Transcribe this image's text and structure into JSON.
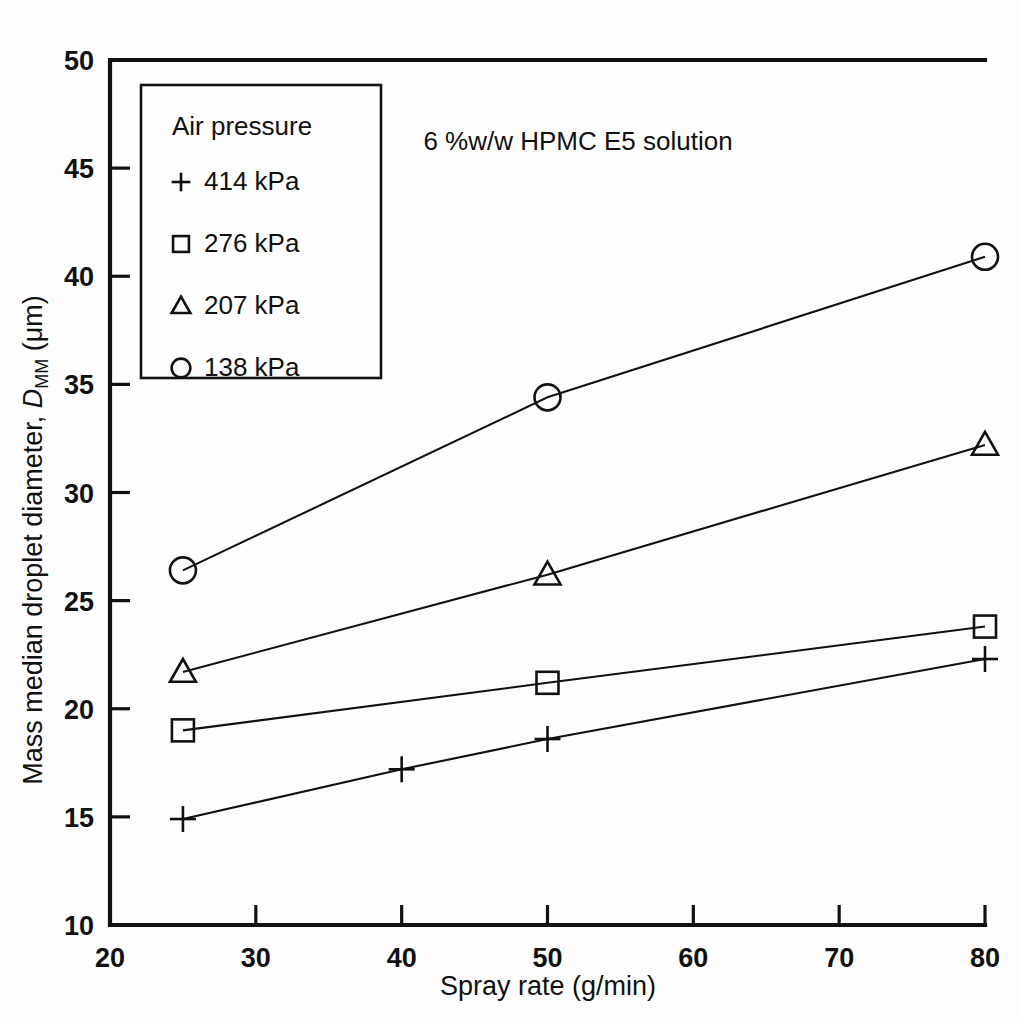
{
  "chart_data": {
    "type": "line",
    "title": "6 %w/w HPMC E5 solution",
    "xlabel": "Spray rate (g/min)",
    "ylabel_prefix": "Mass median droplet diameter, ",
    "ylabel_symbol": "D",
    "ylabel_subscript": "MM",
    "ylabel_units": " (μm)",
    "xlim": [
      20,
      80
    ],
    "ylim": [
      10,
      50
    ],
    "xticks": [
      20,
      30,
      40,
      50,
      60,
      70,
      80
    ],
    "yticks": [
      10,
      15,
      20,
      25,
      30,
      35,
      40,
      45,
      50
    ],
    "grid": false,
    "legend_position": "upper-left-inside",
    "legend_title": "Air pressure",
    "series": [
      {
        "name": "414 kPa",
        "marker": "plus",
        "x": [
          25,
          40,
          50,
          80
        ],
        "values": [
          14.9,
          17.2,
          18.6,
          22.3
        ]
      },
      {
        "name": "276 kPa",
        "marker": "square",
        "x": [
          25,
          50,
          80
        ],
        "values": [
          19.0,
          21.2,
          23.8
        ]
      },
      {
        "name": "207 kPa",
        "marker": "triangle",
        "x": [
          25,
          50,
          80
        ],
        "values": [
          21.7,
          26.2,
          32.2
        ]
      },
      {
        "name": "138 kPa",
        "marker": "circle",
        "x": [
          25,
          50,
          80
        ],
        "values": [
          26.4,
          34.4,
          40.9
        ]
      }
    ]
  },
  "colors": {
    "ink": "#111111",
    "background": "#ffffff"
  }
}
